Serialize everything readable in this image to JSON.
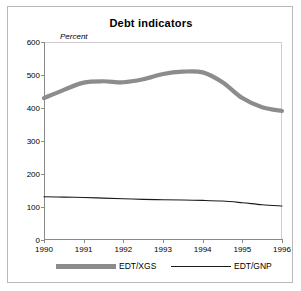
{
  "figure": {
    "title": "Debt indicators",
    "ylabel": "Percent"
  },
  "legend": {
    "entries": [
      {
        "label": "EDT/XGS",
        "style": "thick-gray",
        "color": "#8c8c8c"
      },
      {
        "label": "EDT/GNP",
        "style": "thin-black",
        "color": "#1a1a1a"
      }
    ]
  },
  "chart_data": {
    "type": "line",
    "title": "Debt indicators",
    "xlabel": "",
    "ylabel": "Percent",
    "ylim": [
      0,
      600
    ],
    "yticks": [
      0,
      100,
      200,
      300,
      400,
      500,
      600
    ],
    "xlim": [
      1990,
      1996
    ],
    "xticks": [
      1990,
      1991,
      1992,
      1993,
      1994,
      1995,
      1996
    ],
    "grid": false,
    "legend_position": "bottom",
    "x": [
      1990,
      1990.5,
      1991,
      1991.5,
      1992,
      1992.5,
      1993,
      1993.5,
      1994,
      1994.5,
      1995,
      1995.5,
      1996
    ],
    "series": [
      {
        "name": "EDT/XGS",
        "color": "#8c8c8c",
        "values": [
          430,
          455,
          477,
          481,
          478,
          487,
          503,
          510,
          508,
          478,
          430,
          402,
          391
        ]
      },
      {
        "name": "EDT/GNP",
        "color": "#1a1a1a",
        "values": [
          131,
          130,
          129,
          127,
          125,
          123,
          122,
          121,
          120,
          118,
          113,
          107,
          103
        ]
      }
    ]
  }
}
